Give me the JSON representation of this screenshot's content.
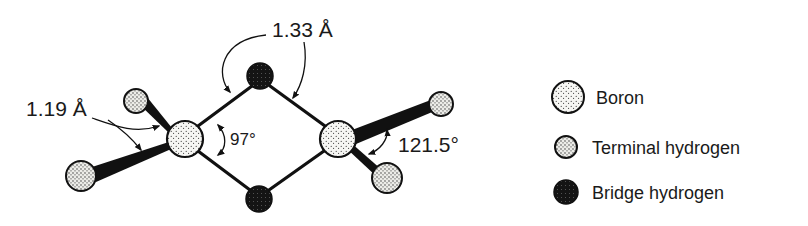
{
  "figure": {
    "labels": {
      "bridge_bond_length": "1.33 Å",
      "terminal_bond_length": "1.19 Å",
      "bridge_angle": "97°",
      "terminal_angle": "121.5°"
    },
    "legend": [
      {
        "label": "Boron",
        "symbol": "boron-atom"
      },
      {
        "label": "Terminal hydrogen",
        "symbol": "terminal-hydrogen-atom"
      },
      {
        "label": "Bridge hydrogen",
        "symbol": "bridge-hydrogen-atom"
      }
    ],
    "colors": {
      "ink": "#111111",
      "atom_fill": "#f4f4f2",
      "bridge_fill": "#1a1a1a",
      "background": "#ffffff"
    }
  }
}
